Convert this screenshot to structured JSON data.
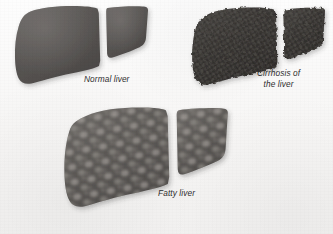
{
  "illustration": {
    "title": "Comparison of liver conditions",
    "background_color": "#fbfafa",
    "style": "grayscale scanned medical illustration"
  },
  "figures": [
    {
      "id": "normal",
      "label": "Normal liver",
      "condition": "normal",
      "surface_texture": "smooth",
      "fill_color": "#595654",
      "edge": "smooth rounded margins",
      "lobes": [
        "left lobe (large)",
        "right lobe (wedge)"
      ],
      "fissure_color": "#ffffff"
    },
    {
      "id": "cirrhosis",
      "label": "Cirrhosis of\nthe liver",
      "condition": "cirrhosis",
      "surface_texture": "nodular bumpy regenerative nodules",
      "fill_color": "#3a3735",
      "edge": "irregular knobby margins",
      "lobes": [
        "left lobe (large)",
        "right lobe (wedge)"
      ],
      "fissure_color": "#ffffff"
    },
    {
      "id": "fatty",
      "label": "Fatty liver",
      "condition": "fatty liver (steatosis)",
      "surface_texture": "mottled pale fat deposits",
      "fill_color": "#5b5856",
      "mottle_color": "#b9b4ae",
      "edge": "smooth enlarged rounded margins",
      "lobes": [
        "left lobe (large, enlarged)",
        "right lobe (wedge)"
      ],
      "fissure_color": "#ffffff"
    }
  ]
}
